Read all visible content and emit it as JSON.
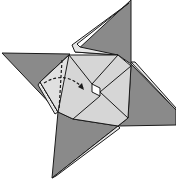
{
  "diagram": {
    "type": "origami-fold-step",
    "colors": {
      "background": "#ffffff",
      "dark_paper": "#8a8a8a",
      "light_paper": "#d6d6d6",
      "edge": "#1a1a1a",
      "hole": "#ffffff"
    },
    "elements": {
      "spikes": [
        "top-spike",
        "left-spike",
        "right-spike",
        "bottom-spike"
      ],
      "center": "light-square-pinwheel",
      "fold_line": "dashed-valley-fold",
      "arrow": "dashed-curved-fold-arrow"
    }
  }
}
